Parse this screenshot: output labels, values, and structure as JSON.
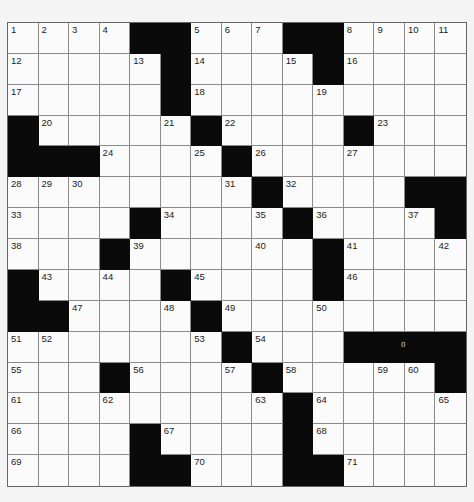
{
  "puzzle": {
    "rows": 15,
    "cols": 15,
    "grid": [
      [
        "1",
        "2",
        "3",
        "4",
        "#",
        "#",
        "5",
        "6",
        "7",
        "#",
        "#",
        "8",
        "9",
        "10",
        "11"
      ],
      [
        "12",
        "",
        "",
        "",
        "13",
        "#",
        "14",
        "",
        "",
        "15",
        "#",
        "16",
        "",
        "",
        ""
      ],
      [
        "17",
        "",
        "",
        "",
        "",
        "#",
        "18",
        "",
        "",
        "",
        "19",
        "",
        "",
        "",
        ""
      ],
      [
        "#",
        "20",
        "",
        "",
        "",
        "21",
        "#",
        "22",
        "",
        "",
        "",
        "#",
        "23",
        "",
        ""
      ],
      [
        "#",
        "#",
        "#",
        "24",
        "",
        "",
        "25",
        "#",
        "26",
        "",
        "",
        "27",
        "",
        "",
        ""
      ],
      [
        "28",
        "29",
        "30",
        "",
        "",
        "",
        "",
        "31",
        "#",
        "32",
        "",
        "",
        "",
        "#",
        "#"
      ],
      [
        "33",
        "",
        "",
        "",
        "#",
        "34",
        "",
        "",
        "35",
        "#",
        "36",
        "",
        "",
        "37",
        "#"
      ],
      [
        "38",
        "",
        "",
        "#",
        "39",
        "",
        "",
        "",
        "40",
        "",
        "#",
        "41",
        "",
        "",
        "42"
      ],
      [
        "#",
        "43",
        "",
        "44",
        "",
        "#",
        "45",
        "",
        "",
        "",
        "#",
        "46",
        "",
        "",
        ""
      ],
      [
        "#",
        "#",
        "47",
        "",
        "",
        "48",
        "#",
        "49",
        "",
        "",
        "50",
        "",
        "",
        "",
        ""
      ],
      [
        "51",
        "52",
        "",
        "",
        "",
        "",
        "53",
        "#",
        "54",
        "",
        "",
        "#",
        "#",
        "#",
        "#"
      ],
      [
        "55",
        "",
        "",
        "#",
        "56",
        "",
        "",
        "57",
        "#",
        "58",
        "",
        "",
        "59",
        "60",
        "#"
      ],
      [
        "61",
        "",
        "",
        "62",
        "",
        "",
        "",
        "",
        "63",
        "#",
        "64",
        "",
        "",
        "",
        "65"
      ],
      [
        "66",
        "",
        "",
        "",
        "#",
        "67",
        "",
        "",
        "",
        "#",
        "68",
        "",
        "",
        "",
        ""
      ],
      [
        "69",
        "",
        "",
        "",
        "#",
        "#",
        "70",
        "",
        "",
        "#",
        "#",
        "71",
        "",
        "",
        ""
      ]
    ],
    "artifact_mark": {
      "text": "0",
      "row": 10,
      "col": 13
    }
  },
  "colors": {
    "block": "#0a0a0a",
    "cell": "#fbfbfb",
    "gridline": "#8a8a8a",
    "number": "#222222"
  }
}
